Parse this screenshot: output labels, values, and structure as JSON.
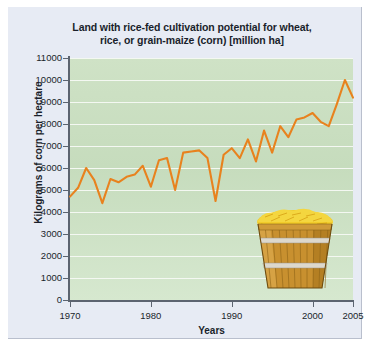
{
  "chart_data": {
    "type": "line",
    "title": "Land with rice-fed cultivation potential for wheat, rice, or grain-maize (corn) [million ha]",
    "title_line1": "Land with rice-fed cultivation potential for wheat,",
    "title_line2": "rice, or grain-maize (corn) [million ha]",
    "xlabel": "Years",
    "ylabel": "Kilograms of corn per hectare",
    "xlim": [
      1970,
      2005
    ],
    "ylim": [
      0,
      11000
    ],
    "grid": true,
    "legend": null,
    "line_color": "#e8821e",
    "xticks": [
      1970,
      1980,
      1990,
      2000,
      2005
    ],
    "xtick_labels": [
      "1970",
      "1980",
      "1990",
      "2000",
      "2005"
    ],
    "yticks": [
      0,
      1000,
      2000,
      3000,
      4000,
      5000,
      6000,
      7000,
      8000,
      9000,
      10000,
      11000
    ],
    "ytick_labels": [
      "0",
      "1000",
      "2000",
      "3000",
      "4000",
      "5000",
      "6000",
      "7000",
      "8000",
      "9000",
      "10000",
      "11000"
    ],
    "x": [
      1970,
      1971,
      1972,
      1973,
      1974,
      1975,
      1976,
      1977,
      1978,
      1979,
      1980,
      1981,
      1982,
      1983,
      1984,
      1985,
      1986,
      1987,
      1988,
      1989,
      1990,
      1991,
      1992,
      1993,
      1994,
      1995,
      1996,
      1997,
      1998,
      1999,
      2000,
      2001,
      2002,
      2003,
      2004,
      2005
    ],
    "values": [
      4700,
      5100,
      6000,
      5450,
      4400,
      5500,
      5350,
      5600,
      5700,
      6100,
      5150,
      6350,
      6450,
      5000,
      6700,
      6750,
      6800,
      6450,
      4500,
      6600,
      6900,
      6450,
      7300,
      6300,
      7700,
      6700,
      7900,
      7400,
      8200,
      8300,
      8500,
      8100,
      7900,
      8900,
      10000,
      9200
    ]
  },
  "illustration": {
    "name": "barrel-of-corn",
    "bands": 2,
    "wood_color": "#c8902f",
    "corn_color": "#f2cc2a"
  }
}
